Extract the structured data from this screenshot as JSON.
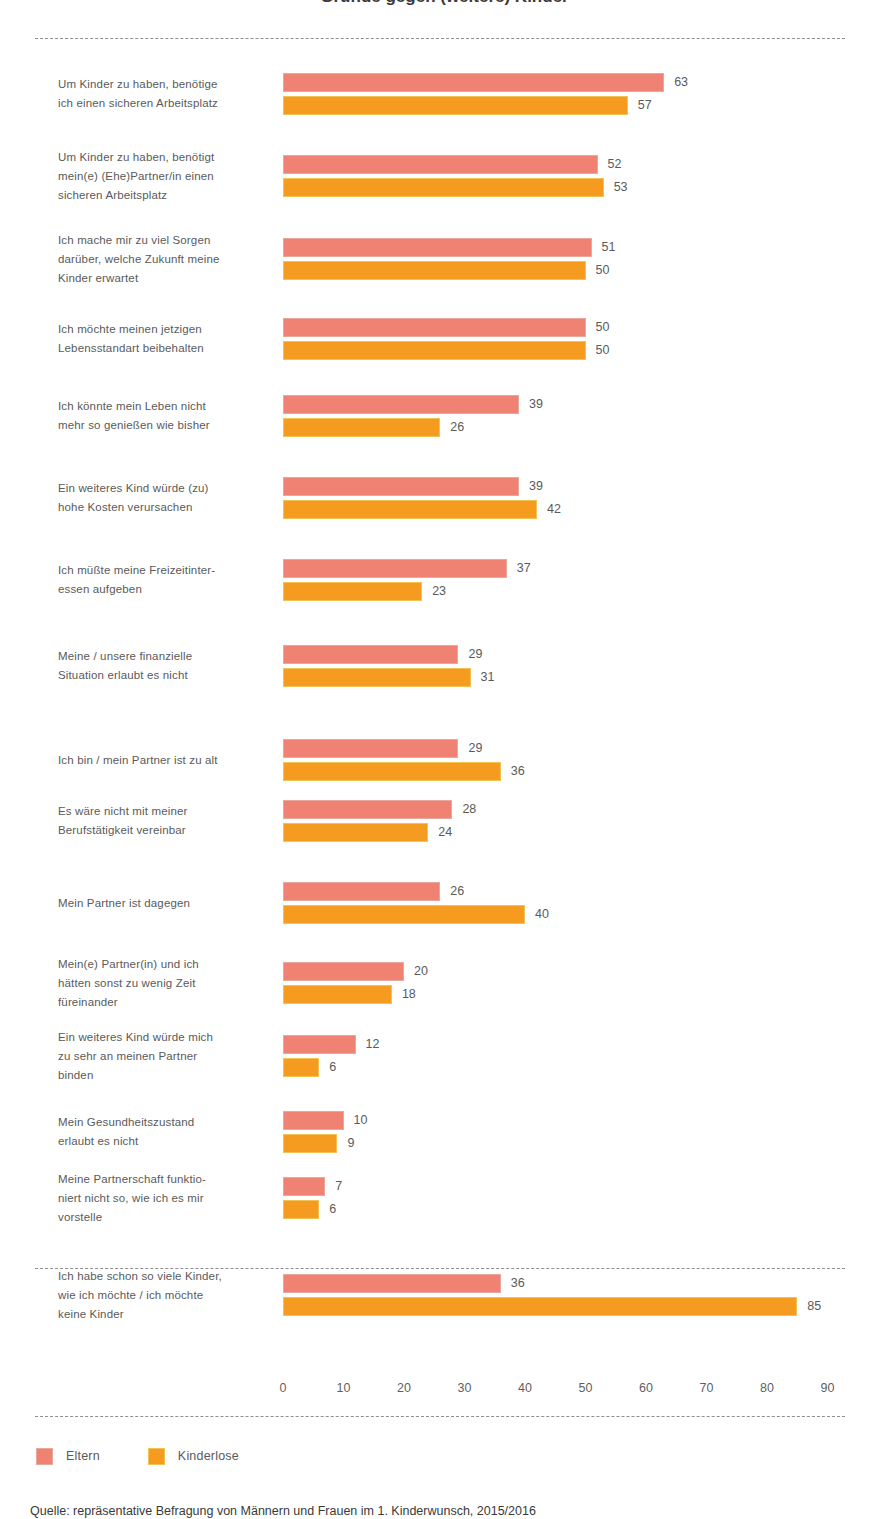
{
  "title": "Gründe gegen (weitere) Kinder",
  "source_note": "Quelle: repräsentative Befragung von Männern und Frauen im 1. Kinderwunsch, 2015/2016",
  "legend": {
    "position": "bottom-left",
    "items": [
      {
        "label": "Eltern",
        "color": "#ef8272"
      },
      {
        "label": "Kinderlose",
        "color": "#f59b20"
      }
    ]
  },
  "axis": {
    "ticks": [
      "0",
      "10",
      "20",
      "30",
      "40",
      "50",
      "60",
      "70",
      "80",
      "90"
    ],
    "min": 0,
    "max": 90,
    "step": 10,
    "grid": false
  },
  "chart_data": {
    "type": "bar",
    "orientation": "horizontal",
    "title": "Gründe gegen (weitere) Kinder",
    "xlabel": "",
    "ylabel": "",
    "xlim": [
      0,
      90
    ],
    "grid": false,
    "legend_position": "bottom-left",
    "categories": [
      "Um Kinder zu haben, benötige ich einen sicheren Arbeitsplatz",
      "Um Kinder zu haben, benötigt mein(e) (Ehe)Partner/in einen sicheren Arbeitsplatz",
      "Ich mache mir zu viel Sorgen darüber, welche Zukunft meine Kinder erwartet",
      "Ich möchte meinen jetzigen Lebensstandart beibehalten",
      "Ich könnte mein Leben nicht mehr so genießen wie bisher",
      "Ein weiteres Kind würde (zu) hohe Kosten verursachen",
      "Ich müßte meine Freizeitinteressen aufgeben",
      "Meine / unsere finanzielle Situation erlaubt es nicht",
      "Ich bin / mein Partner ist zu alt",
      "Es wäre nicht mit meiner Berufstätigkeit vereinbar",
      "Mein Partner ist dagegen",
      "Mein(e) Partner(in) und ich hätten sonst zu wenig Zeit füreinander",
      "Ein weiteres Kind würde mich zu sehr an meinen Partner binden",
      "Mein Gesundheitszustand erlaubt es nicht",
      "Meine Partnerschaft funktioniert nicht so, wie ich es mir vorstelle",
      "Ich habe schon so viele Kinder, wie ich möchte / ich möchte keine Kinder"
    ],
    "series": [
      {
        "name": "Eltern",
        "color": "#ef8272",
        "values": [
          63,
          52,
          51,
          50,
          39,
          39,
          37,
          29,
          29,
          28,
          26,
          20,
          12,
          10,
          7,
          36
        ]
      },
      {
        "name": "Kinderlose",
        "color": "#f59b20",
        "values": [
          57,
          53,
          50,
          50,
          26,
          42,
          23,
          31,
          36,
          24,
          40,
          18,
          6,
          9,
          6,
          85
        ]
      }
    ]
  },
  "rows": [
    {
      "lines": [
        "Um Kinder zu haben, benötige",
        "ich einen sicheren Arbeitsplatz"
      ],
      "eltern": 63,
      "kinderlose": 57
    },
    {
      "lines": [
        "Um Kinder zu haben, benötigt",
        "mein(e) (Ehe)Partner/in einen",
        "sicheren Arbeitsplatz"
      ],
      "eltern": 52,
      "kinderlose": 53
    },
    {
      "lines": [
        "Ich mache mir zu viel Sorgen",
        "darüber, welche Zukunft meine",
        "Kinder erwartet"
      ],
      "eltern": 51,
      "kinderlose": 50
    },
    {
      "lines": [
        "Ich möchte meinen jetzigen",
        "Lebensstandart beibehalten"
      ],
      "eltern": 50,
      "kinderlose": 50
    },
    {
      "lines": [
        "Ich könnte mein Leben nicht",
        "mehr so genießen wie bisher"
      ],
      "eltern": 39,
      "kinderlose": 26
    },
    {
      "lines": [
        "Ein weiteres Kind würde (zu)",
        "hohe Kosten verursachen"
      ],
      "eltern": 39,
      "kinderlose": 42
    },
    {
      "lines": [
        "Ich müßte meine Freizeitinter-",
        "essen aufgeben"
      ],
      "eltern": 37,
      "kinderlose": 23
    },
    {
      "lines": [
        "Meine / unsere finanzielle",
        "Situation erlaubt es nicht"
      ],
      "eltern": 29,
      "kinderlose": 31
    },
    {
      "lines": [
        "Ich bin / mein Partner ist zu alt"
      ],
      "eltern": 29,
      "kinderlose": 36
    },
    {
      "lines": [
        "Es wäre nicht mit meiner",
        "Berufstätigkeit vereinbar"
      ],
      "eltern": 28,
      "kinderlose": 24
    },
    {
      "lines": [
        "Mein Partner ist dagegen"
      ],
      "eltern": 26,
      "kinderlose": 40
    },
    {
      "lines": [
        "Mein(e) Partner(in) und ich",
        "hätten sonst zu wenig Zeit",
        "füreinander"
      ],
      "eltern": 20,
      "kinderlose": 18
    },
    {
      "lines": [
        "Ein weiteres Kind würde mich",
        "zu sehr an meinen Partner",
        "binden"
      ],
      "eltern": 12,
      "kinderlose": 6
    },
    {
      "lines": [
        "Mein Gesundheitszustand",
        "erlaubt es nicht"
      ],
      "eltern": 10,
      "kinderlose": 9
    },
    {
      "lines": [
        "Meine Partnerschaft funktio-",
        "niert nicht so, wie ich es mir",
        "vorstelle"
      ],
      "eltern": 7,
      "kinderlose": 6
    },
    {
      "lines": [
        "Ich habe schon so viele Kinder,",
        "wie ich möchte / ich möchte",
        "keine Kinder"
      ],
      "eltern": 36,
      "kinderlose": 85
    }
  ]
}
